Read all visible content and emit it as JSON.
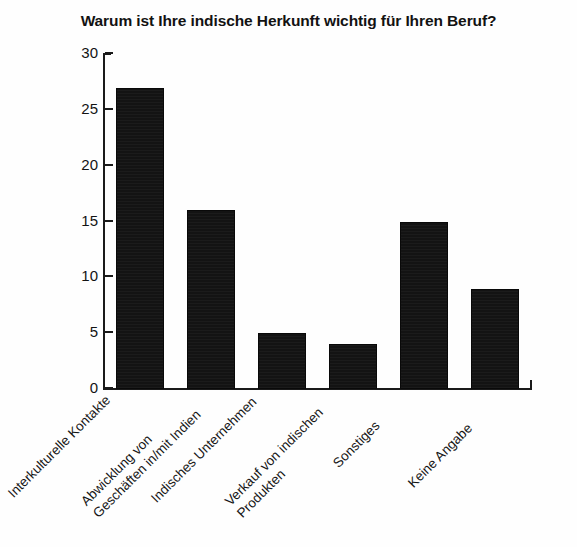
{
  "chart_data": {
    "type": "bar",
    "title": "Warum ist Ihre indische Herkunft wichtig für Ihren Beruf?",
    "xlabel": "",
    "ylabel": "",
    "ylim": [
      0,
      30
    ],
    "yticks": [
      0,
      5,
      10,
      15,
      20,
      25,
      30
    ],
    "grid": false,
    "legend": false,
    "bar_color": "#131313",
    "categories": [
      "Interkulturelle Kontakte",
      "Abwicklung von Geschäften in/mit Indien",
      "Indisches Unternehmen",
      "Verkauf von indischen Produkten",
      "Sonstiges",
      "Keine Angabe"
    ],
    "category_lines": [
      [
        "Interkulturelle Kontakte"
      ],
      [
        "Abwicklung von",
        "Geschäften in/mit Indien"
      ],
      [
        "Indisches Unternehmen"
      ],
      [
        "Verkauf von indischen",
        "Produkten"
      ],
      [
        "Sonstiges"
      ],
      [
        "Keine Angabe"
      ]
    ],
    "values": [
      27,
      16,
      5,
      4,
      15,
      9
    ]
  }
}
